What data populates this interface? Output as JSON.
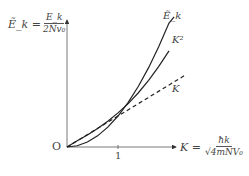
{
  "chart_data": {
    "type": "line",
    "title": "",
    "ylabel": {
      "lhs": "Ẽ_k =",
      "num": "E_k",
      "den": "2Nv₀"
    },
    "xlabel": {
      "lhs": "K =",
      "num": "ħk",
      "den": "√4mNV₀"
    },
    "origin_label": "O",
    "x_ticks": [
      "1"
    ],
    "xlim": [
      0,
      2.4
    ],
    "ylim": [
      0,
      4.2
    ],
    "grid": false,
    "series": [
      {
        "name": "Ẽ_k",
        "style": "solid",
        "x": [
          0,
          0.2,
          0.4,
          0.6,
          0.8,
          1.0,
          1.2,
          1.4,
          1.6,
          1.8,
          2.0
        ],
        "y": [
          0,
          0.2,
          0.39,
          0.6,
          0.83,
          1.1,
          1.4,
          1.75,
          2.15,
          2.6,
          3.1
        ]
      },
      {
        "name": "K²",
        "style": "solid",
        "x": [
          0,
          0.2,
          0.4,
          0.6,
          0.8,
          1.0,
          1.2,
          1.4,
          1.6,
          1.8,
          2.0,
          2.1
        ],
        "y": [
          0,
          0.04,
          0.16,
          0.36,
          0.64,
          1.0,
          1.44,
          1.96,
          2.56,
          3.24,
          4.0,
          4.2
        ]
      },
      {
        "name": "K",
        "style": "dashed",
        "x": [
          0,
          2.3
        ],
        "y": [
          0,
          2.3
        ]
      }
    ]
  }
}
